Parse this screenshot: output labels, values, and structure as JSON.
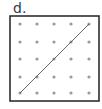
{
  "label": "d.",
  "diagram": {
    "type": "dot-grid",
    "rows": 5,
    "cols": 5,
    "box": {
      "x": 10,
      "y": 16,
      "width": 89,
      "height": 85,
      "stroke": "#222222",
      "stroke_width": 1.5
    },
    "dot_xs": [
      20,
      37,
      54,
      71,
      89
    ],
    "dot_ys": [
      24,
      42,
      59,
      77,
      93
    ],
    "dot_color": "#9a9a9a",
    "dot_radius": 1.6,
    "line": {
      "from": {
        "col": 0,
        "row": 4
      },
      "to": {
        "col": 4,
        "row": 0
      },
      "color": "#555555",
      "width": 0.9
    }
  }
}
